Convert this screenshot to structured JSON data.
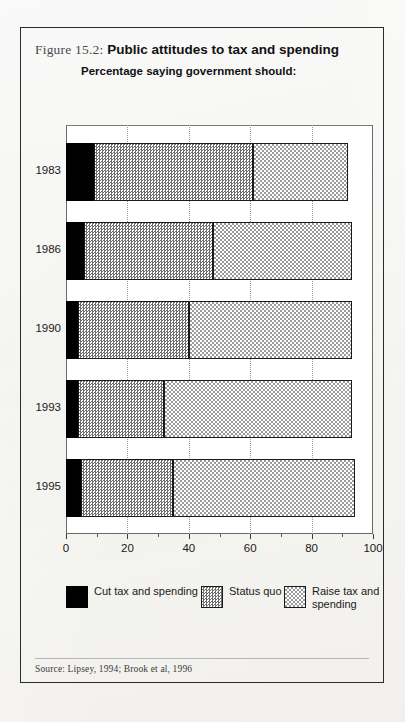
{
  "figure": {
    "label": "Figure 15.2:",
    "title": "Public attitudes to tax and spending",
    "subtitle": "Percentage saying government should:",
    "source": "Source: Lipsey, 1994; Brook et al, 1996"
  },
  "legend": {
    "items": [
      {
        "name": "cut",
        "label": "Cut tax and spending",
        "color": "#000000"
      },
      {
        "name": "status",
        "label": "Status quo",
        "color": "#6f6f6f"
      },
      {
        "name": "raise",
        "label": "Raise tax and spending",
        "color": "#9a9a9a"
      }
    ]
  },
  "axis": {
    "ticks": [
      "0",
      "20",
      "40",
      "60",
      "80",
      "100"
    ],
    "tick_values": [
      0,
      20,
      40,
      60,
      80,
      100
    ],
    "minor_values": [
      10,
      30,
      50,
      70,
      90
    ]
  },
  "chart_data": {
    "type": "bar",
    "orientation": "horizontal",
    "stacked": true,
    "title": "Public attitudes to tax and spending",
    "subtitle": "Percentage saying government should:",
    "xlabel": "",
    "ylabel": "",
    "xlim": [
      0,
      100
    ],
    "grid": "vertical-dotted",
    "legend_position": "bottom",
    "categories": [
      "1983",
      "1986",
      "1990",
      "1993",
      "1995"
    ],
    "series": [
      {
        "name": "Cut tax and spending",
        "values": [
          9,
          6,
          4,
          4,
          5
        ]
      },
      {
        "name": "Status quo",
        "values": [
          52,
          42,
          36,
          28,
          30
        ]
      },
      {
        "name": "Raise tax and spending",
        "values": [
          31,
          45,
          53,
          61,
          59
        ]
      }
    ],
    "totals": [
      92,
      93,
      93,
      93,
      94
    ],
    "source": "Lipsey, 1994; Brook et al, 1996"
  }
}
